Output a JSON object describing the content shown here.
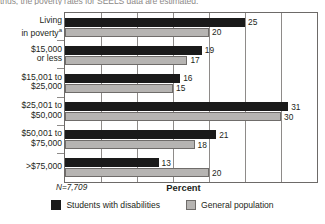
{
  "caption": "thus, the poverty rates for SEELS data are estimated.",
  "chart_data": {
    "type": "bar",
    "orientation": "horizontal",
    "title": "",
    "xlabel": "Percent",
    "ylabel": "",
    "xlim": [
      0,
      35
    ],
    "xticks": [
      0,
      5,
      10,
      15,
      20,
      25,
      30,
      35
    ],
    "grid": true,
    "legend_position": "bottom-center",
    "note": "N=7,709",
    "categories": [
      "Living\nin poverty*",
      "$15,000\nor less",
      "$15,001 to\n$25,000",
      "$25,001 to\n$50,000",
      "$50,001 to\n$75,000",
      ">$75,000"
    ],
    "series": [
      {
        "name": "Students with disabilities",
        "color": "#1a1a1a",
        "values": [
          25,
          19,
          16,
          31,
          21,
          13
        ]
      },
      {
        "name": "General population",
        "color": "#b6b4b2",
        "values": [
          20,
          17,
          15,
          30,
          18,
          20
        ]
      }
    ]
  }
}
